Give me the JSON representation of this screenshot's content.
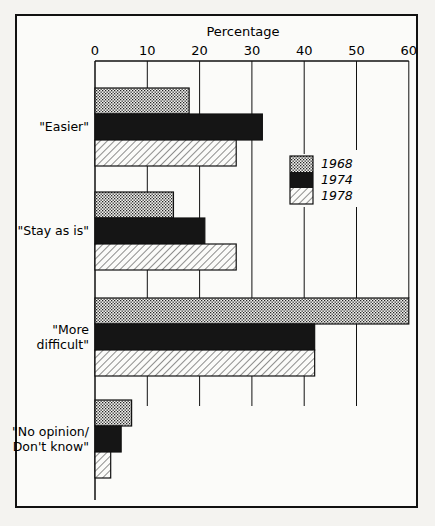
{
  "chart_data": {
    "type": "bar",
    "orientation": "horizontal",
    "title": "Percentage",
    "xlabel": "Percentage",
    "ylabel": "",
    "xlim": [
      0,
      60
    ],
    "xticks": [
      0,
      10,
      20,
      30,
      40,
      50,
      60
    ],
    "grid": true,
    "legend_position": "inside-right",
    "categories": [
      "\"Easier\"",
      "\"Stay as is\"",
      "\"More difficult\"",
      "\"No opinion/ Don't know\""
    ],
    "category_lines": [
      [
        "\"Easier\""
      ],
      [
        "\"Stay as is\""
      ],
      [
        "\"More",
        "difficult\""
      ],
      [
        "\"No opinion/",
        "Don't know\""
      ]
    ],
    "series": [
      {
        "name": "1968",
        "pattern": "dots",
        "values": [
          18,
          15,
          60,
          7
        ]
      },
      {
        "name": "1974",
        "pattern": "solid",
        "values": [
          32,
          21,
          42,
          5
        ]
      },
      {
        "name": "1978",
        "pattern": "hatch",
        "values": [
          27,
          27,
          42,
          3
        ]
      }
    ]
  },
  "colors": {
    "ink": "#111111",
    "paper": "#fbfbf9"
  }
}
